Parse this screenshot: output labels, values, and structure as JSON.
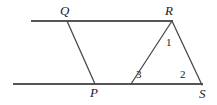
{
  "figure": {
    "type": "geometry-diagram",
    "background_color": "#ffffff",
    "stroke_color": "#4a4a4a",
    "label_color": "#1a1a1a",
    "vertices": [
      {
        "id": "Q",
        "label": "Q",
        "x": 67,
        "y": 21,
        "label_x": 60,
        "label_y": 4
      },
      {
        "id": "R",
        "label": "R",
        "x": 172,
        "y": 21,
        "label_x": 165,
        "label_y": 4
      },
      {
        "id": "P",
        "label": "P",
        "x": 95,
        "y": 84,
        "label_x": 90,
        "label_y": 86
      },
      {
        "id": "S",
        "label": "S",
        "x": 202,
        "y": 85,
        "label_x": 199,
        "label_y": 87
      }
    ],
    "angles": [
      {
        "id": "angle-1",
        "label": "1",
        "label_x": 166,
        "label_y": 37
      },
      {
        "id": "angle-3",
        "label": "3",
        "label_x": 136,
        "label_y": 69
      },
      {
        "id": "angle-2",
        "label": "2",
        "label_x": 180,
        "label_y": 69
      }
    ],
    "lines": {
      "top_parallel": {
        "x1": 31,
        "y1": 21,
        "x2": 173,
        "y2": 21
      },
      "bottom_parallel": {
        "x1": 13,
        "y1": 84,
        "x2": 203,
        "y2": 84
      }
    },
    "segments": [
      {
        "id": "segment-QP",
        "from": "Q",
        "to": "P",
        "x1": 67,
        "y1": 21,
        "x2": 95,
        "y2": 84
      },
      {
        "id": "segment-RP",
        "from": "R",
        "to": "P-side",
        "x1": 172,
        "y1": 21,
        "x2": 131,
        "y2": 84
      },
      {
        "id": "segment-RS",
        "from": "R",
        "to": "S",
        "x1": 172,
        "y1": 21,
        "x2": 202,
        "y2": 85
      }
    ]
  }
}
